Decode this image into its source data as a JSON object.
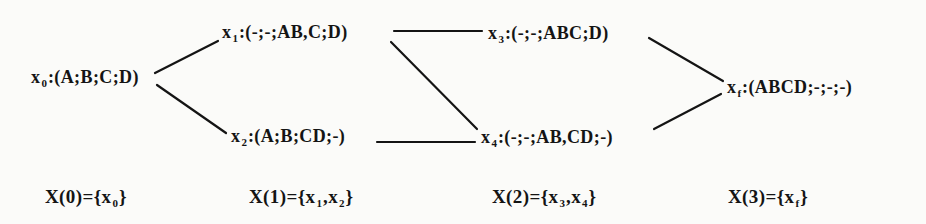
{
  "figure": {
    "kind": "staged-state-graph",
    "paper_color": "#fbfbf9",
    "ink_color": "#141414"
  },
  "nodes": [
    {
      "id": "x0",
      "name": "x",
      "sub": "0",
      "rest": ":(A;B;C;D)"
    },
    {
      "id": "x1",
      "name": "x",
      "sub": "1",
      "rest": ":(-;-;AB,C;D)"
    },
    {
      "id": "x2",
      "name": "x",
      "sub": "2",
      "rest": ":(A;B;CD;-)"
    },
    {
      "id": "x3",
      "name": "x",
      "sub": "3",
      "rest": ":(-;-;ABC;D)"
    },
    {
      "id": "x4",
      "name": "x",
      "sub": "4",
      "rest": ":(-;-;AB,CD;-)"
    },
    {
      "id": "xf",
      "name": "x",
      "sub": "f",
      "rest": ":(ABCD;-;-;-)"
    }
  ],
  "edges": [
    {
      "from": "x0",
      "to": "x1"
    },
    {
      "from": "x0",
      "to": "x2"
    },
    {
      "from": "x1",
      "to": "x3"
    },
    {
      "from": "x1",
      "to": "x4"
    },
    {
      "from": "x2",
      "to": "x4"
    },
    {
      "from": "x3",
      "to": "xf"
    },
    {
      "from": "x4",
      "to": "xf"
    }
  ],
  "stage_labels": [
    {
      "segments": [
        "X(0)={x",
        "0",
        "}"
      ]
    },
    {
      "segments": [
        "X(1)={x",
        "1",
        ",x",
        "2",
        "}"
      ]
    },
    {
      "segments": [
        "X(2)={x",
        "3",
        ",x",
        "4",
        "}"
      ]
    },
    {
      "segments": [
        "X(3)={x",
        "f",
        "}"
      ]
    }
  ]
}
